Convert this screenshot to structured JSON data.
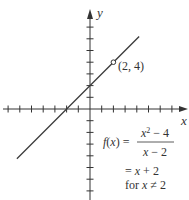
{
  "chart_data": {
    "type": "line",
    "title": "",
    "xlabel": "x",
    "ylabel": "y",
    "xlim": [
      -7.5,
      8.5
    ],
    "ylim": [
      -7.7,
      8.3
    ],
    "grid": false,
    "x_ticks": [
      -7,
      -6,
      -5,
      -4,
      -3,
      -2,
      -1,
      1,
      2,
      3,
      4,
      5,
      6,
      7
    ],
    "y_ticks": [
      -7,
      -6,
      -5,
      -4,
      -3,
      -2,
      -1,
      1,
      2,
      3,
      4,
      5,
      6,
      7
    ],
    "series": [
      {
        "name": "f(x) = (x^2 - 4)/(x - 2)",
        "x": [
          -6.25,
          4.2
        ],
        "y": [
          -4.25,
          6.2
        ],
        "equation": "y = x + 2"
      }
    ],
    "annotations": [
      {
        "type": "open-circle",
        "x": 2,
        "y": 4,
        "label": "(2, 4)"
      }
    ]
  },
  "labels": {
    "x_axis": "x",
    "y_axis": "y",
    "point": "(2, 4)",
    "f_lhs": "f(x) =",
    "numerator_base": "x",
    "numerator_exp": "2",
    "numerator_rest": " − 4",
    "denominator": "x − 2",
    "simplified": "= x + 2",
    "condition": "for x ≠ 2"
  },
  "colors": {
    "axis": "#333333",
    "line": "#3a3a3a",
    "text": "#333333",
    "background": "#ffffff"
  }
}
